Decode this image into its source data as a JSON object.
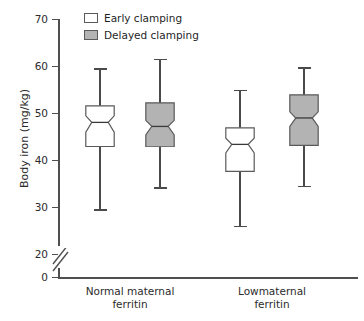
{
  "chart_data": {
    "type": "box",
    "title": "",
    "xlabel": "",
    "ylabel": "Body iron (mg/kg)",
    "ylim": [
      0,
      70
    ],
    "y_ticks": [
      0,
      20,
      30,
      40,
      50,
      60,
      70
    ],
    "y_tick_labels": [
      "0",
      "20",
      "30",
      "40",
      "50",
      "60",
      "70"
    ],
    "axis_break": true,
    "grid": false,
    "legend_position": "top-left",
    "categories": [
      "Normal maternal\nferritin",
      "Lowmaternal\nferritin"
    ],
    "series": [
      {
        "name": "Early clamping",
        "fill": "#ffffff",
        "boxes": [
          {
            "category": "Normal maternal ferritin",
            "whisker_low": 29.5,
            "q1": 42.7,
            "median": 48.0,
            "notch_low": 45.9,
            "notch_high": 49.4,
            "q3": 51.7,
            "whisker_high": 59.5
          },
          {
            "category": "Lowmaternal ferritin",
            "whisker_low": 26.0,
            "q1": 37.4,
            "median": 43.3,
            "notch_low": 41.5,
            "notch_high": 44.6,
            "q3": 47.0,
            "whisker_high": 55.0
          }
        ]
      },
      {
        "name": "Delayed clamping",
        "fill": "#b3b3b3",
        "boxes": [
          {
            "category": "Normal maternal ferritin",
            "whisker_low": 34.2,
            "q1": 42.7,
            "median": 47.2,
            "notch_low": 45.4,
            "notch_high": 48.5,
            "q3": 52.4,
            "whisker_high": 61.5
          },
          {
            "category": "Lowmaternal ferritin",
            "whisker_low": 34.5,
            "q1": 43.0,
            "median": 49.0,
            "notch_low": 47.2,
            "notch_high": 50.3,
            "q3": 54.1,
            "whisker_high": 59.7
          }
        ]
      }
    ]
  },
  "legend": {
    "items": [
      {
        "label": "Early clamping",
        "color": "#ffffff"
      },
      {
        "label": "Delayed clamping",
        "color": "#b3b3b3"
      }
    ]
  },
  "axis": {
    "y_title": "Body iron (mg/kg)",
    "y_tick_labels": [
      "70",
      "60",
      "50",
      "40",
      "30",
      "20",
      "0"
    ],
    "x_categories": [
      "Normal maternal\nferritin",
      "Lowmaternal\nferritin"
    ]
  },
  "colors": {
    "axis": "#4f4f4f",
    "box_outline": "#5a5a5a",
    "early_fill": "#ffffff",
    "delayed_fill": "#b3b3b3",
    "text": "#2b2b2b"
  }
}
